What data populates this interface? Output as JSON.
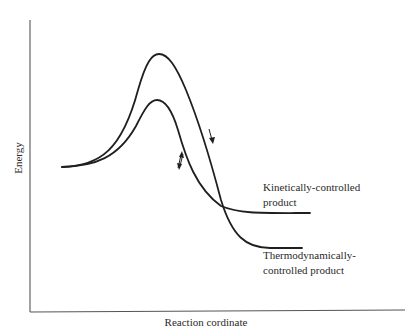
{
  "diagram": {
    "type": "reaction-energy-profile",
    "axes": {
      "y_label": "Energy",
      "x_label": "Reaction cordinate"
    },
    "curves": [
      {
        "name": "thermodynamic-pathway",
        "description": "Higher activation barrier leading to lower-energy product",
        "end_label_lines": [
          "Thermodynamically-",
          "controlled product"
        ]
      },
      {
        "name": "kinetic-pathway",
        "description": "Lower activation barrier leading to higher-energy product",
        "end_label_lines": [
          "Kinetically-controlled",
          "product"
        ]
      }
    ],
    "arrows": [
      {
        "name": "equilibrium-arrows",
        "description": "reversible (up and down) arrows beside kinetic pathway descent"
      },
      {
        "name": "irreversible-arrow",
        "description": "single downward arrow beside thermodynamic pathway descent"
      }
    ],
    "colors": {
      "line": "#1f1f1f",
      "axis": "#555555",
      "text": "#2a2a2a",
      "background": "#ffffff"
    }
  }
}
